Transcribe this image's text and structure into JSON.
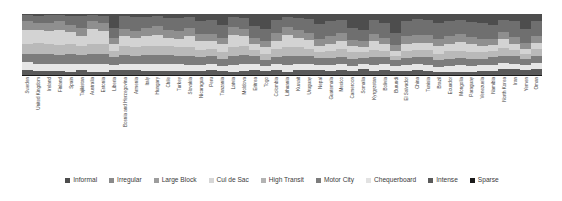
{
  "chart_data": {
    "type": "bar",
    "stacked": true,
    "normalized": true,
    "orientation": "vertical",
    "title": "",
    "subtitle": "",
    "xlabel": "",
    "ylabel": "",
    "ylim": [
      0,
      100
    ],
    "grid": false,
    "legend_position": "bottom",
    "categories": [
      "Sweden",
      "United Kingdom",
      "Ireland",
      "Finland",
      "Spain",
      "Tajikistan",
      "Australia",
      "Estonia",
      "Liberia",
      "Bosnia and Herzegovina",
      "Armenia",
      "Italy",
      "Hungary",
      "Chile",
      "Turkey",
      "Slovakia",
      "Nicaragua",
      "Peru",
      "Tanzania",
      "Latvia",
      "Moldova",
      "Eritrea",
      "Togo",
      "Colombia",
      "Lithuania",
      "Kuwait",
      "Uruguay",
      "Nepal",
      "Guatemala",
      "Mexico",
      "Cameroon",
      "Somalia",
      "Kyrgyzstan",
      "Bolivia",
      "Burundi",
      "El Salvador",
      "China",
      "Tunisia",
      "Brazil",
      "Ecuador",
      "Mongolia",
      "Paraguay",
      "Venezuela",
      "Namibia",
      "North Korea",
      "Iran",
      "Yemen",
      "Oman"
    ],
    "series": [
      {
        "name": "Informal",
        "color": "#4d4d4d",
        "values": [
          2,
          3,
          2,
          2,
          3,
          4,
          2,
          3,
          22,
          4,
          5,
          5,
          4,
          6,
          6,
          5,
          12,
          10,
          18,
          5,
          6,
          20,
          24,
          9,
          5,
          6,
          8,
          16,
          12,
          9,
          22,
          26,
          10,
          14,
          30,
          12,
          8,
          10,
          14,
          12,
          10,
          13,
          15,
          18,
          9,
          11,
          24,
          12
        ]
      },
      {
        "name": "Irregular",
        "color": "#6f6f6f",
        "values": [
          10,
          11,
          12,
          10,
          14,
          18,
          10,
          12,
          16,
          20,
          22,
          18,
          16,
          20,
          22,
          18,
          20,
          22,
          20,
          16,
          18,
          18,
          20,
          22,
          16,
          20,
          22,
          24,
          24,
          22,
          20,
          18,
          22,
          24,
          20,
          24,
          26,
          24,
          26,
          24,
          22,
          24,
          26,
          22,
          20,
          26,
          22,
          24
        ]
      },
      {
        "name": "Large Block",
        "color": "#8f8f8f",
        "values": [
          14,
          12,
          13,
          14,
          12,
          14,
          13,
          12,
          10,
          12,
          12,
          13,
          14,
          12,
          12,
          13,
          12,
          12,
          11,
          13,
          12,
          10,
          10,
          12,
          13,
          12,
          12,
          11,
          12,
          12,
          10,
          10,
          12,
          11,
          9,
          12,
          12,
          12,
          12,
          12,
          13,
          12,
          11,
          10,
          12,
          11,
          10,
          11
        ]
      },
      {
        "name": "Cul de Sac",
        "color": "#d3d3d3",
        "values": [
          22,
          20,
          22,
          24,
          20,
          16,
          24,
          22,
          12,
          16,
          14,
          16,
          18,
          14,
          14,
          18,
          14,
          12,
          12,
          20,
          16,
          10,
          10,
          14,
          20,
          16,
          14,
          10,
          12,
          14,
          10,
          8,
          14,
          10,
          8,
          12,
          12,
          12,
          12,
          12,
          14,
          12,
          10,
          10,
          14,
          10,
          8,
          10
        ]
      },
      {
        "name": "High Transit",
        "color": "#b9b9b9",
        "values": [
          16,
          18,
          16,
          16,
          16,
          14,
          16,
          16,
          10,
          14,
          14,
          14,
          14,
          14,
          14,
          14,
          12,
          12,
          11,
          14,
          14,
          10,
          10,
          12,
          14,
          14,
          12,
          10,
          11,
          12,
          10,
          9,
          12,
          10,
          8,
          11,
          11,
          12,
          11,
          12,
          12,
          11,
          10,
          10,
          12,
          10,
          9,
          10
        ]
      },
      {
        "name": "Motor City",
        "color": "#7c7c7c",
        "values": [
          14,
          16,
          15,
          14,
          16,
          14,
          16,
          16,
          12,
          14,
          14,
          14,
          14,
          14,
          12,
          14,
          12,
          12,
          12,
          14,
          14,
          12,
          10,
          12,
          14,
          12,
          12,
          11,
          11,
          12,
          12,
          10,
          12,
          11,
          9,
          12,
          12,
          12,
          11,
          12,
          12,
          12,
          11,
          12,
          12,
          12,
          10,
          12
        ]
      },
      {
        "name": "Chequerboard",
        "color": "#e6e6e6",
        "values": [
          12,
          12,
          12,
          12,
          12,
          10,
          12,
          12,
          8,
          10,
          10,
          12,
          12,
          12,
          12,
          10,
          10,
          10,
          8,
          12,
          12,
          10,
          8,
          10,
          12,
          10,
          10,
          9,
          10,
          10,
          8,
          8,
          10,
          10,
          8,
          9,
          10,
          10,
          8,
          9,
          10,
          9,
          9,
          10,
          10,
          8,
          8,
          10
        ]
      },
      {
        "name": "Intense",
        "color": "#5a5a5a",
        "values": [
          8,
          7,
          7,
          7,
          6,
          8,
          6,
          6,
          8,
          8,
          8,
          7,
          7,
          7,
          7,
          7,
          7,
          8,
          7,
          5,
          7,
          8,
          7,
          7,
          5,
          9,
          8,
          8,
          7,
          8,
          7,
          9,
          7,
          9,
          7,
          7,
          8,
          7,
          5,
          6,
          6,
          6,
          7,
          7,
          10,
          11,
          8,
          10
        ]
      },
      {
        "name": "Sparse",
        "color": "#1a1a1a",
        "values": [
          2,
          1,
          1,
          1,
          1,
          2,
          1,
          1,
          2,
          2,
          1,
          1,
          1,
          1,
          1,
          1,
          1,
          2,
          1,
          1,
          1,
          2,
          1,
          2,
          1,
          1,
          2,
          1,
          1,
          1,
          1,
          2,
          1,
          1,
          1,
          1,
          1,
          1,
          1,
          1,
          1,
          1,
          1,
          1,
          1,
          1,
          1,
          1
        ]
      }
    ]
  },
  "legend": {
    "items": [
      {
        "label": "Informal",
        "color": "#4d4d4d"
      },
      {
        "label": "Irregular",
        "color": "#8a8a8a"
      },
      {
        "label": "Large Block",
        "color": "#9d9d9d"
      },
      {
        "label": "Cul de Sac",
        "color": "#d6d6d6"
      },
      {
        "label": "High Transit",
        "color": "#b3b3b3"
      },
      {
        "label": "Motor City",
        "color": "#7c7c7c"
      },
      {
        "label": "Chequerboard",
        "color": "#e2e2e2"
      },
      {
        "label": "Intense",
        "color": "#5a5a5a"
      },
      {
        "label": "Sparse",
        "color": "#1a1a1a"
      }
    ]
  }
}
